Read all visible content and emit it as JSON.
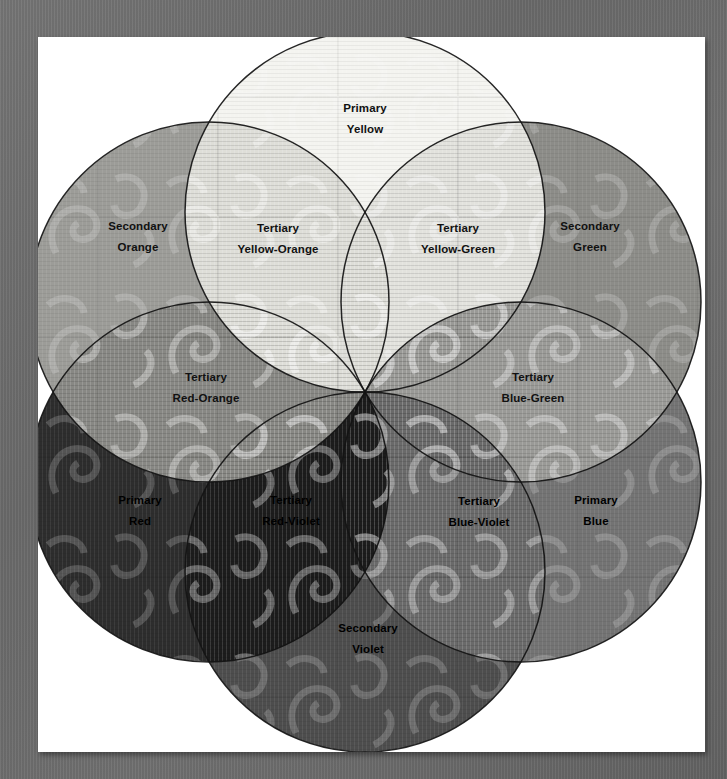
{
  "diagram": {
    "type": "color-wheel-venn",
    "center": {
      "x": 327,
      "y": 355
    },
    "radius": 180,
    "circle_count": 6,
    "petal_count": 12,
    "background": "#ffffff",
    "frame_color": "#6e6e6e",
    "outline_color": "#1a1a1a",
    "note": "Grayscale reproduction of a color wheel; hues rendered as gray tones"
  },
  "circles": [
    {
      "name": "yellow",
      "label": "Yellow",
      "angle_deg": 270,
      "tone": "#f2f2ee",
      "cx": 327,
      "cy": 175
    },
    {
      "name": "green",
      "label": "Green",
      "angle_deg": 330,
      "tone": "#8d8d8a",
      "cx": 483,
      "cy": 265
    },
    {
      "name": "blue",
      "label": "Blue",
      "angle_deg": 30,
      "tone": "#6f6f6f",
      "cx": 483,
      "cy": 445
    },
    {
      "name": "violet",
      "label": "Violet",
      "angle_deg": 90,
      "tone": "#4b4b4b",
      "cx": 327,
      "cy": 535
    },
    {
      "name": "red",
      "label": "Red",
      "angle_deg": 150,
      "tone": "#2c2c2c",
      "cx": 171,
      "cy": 445
    },
    {
      "name": "orange",
      "label": "Orange",
      "angle_deg": 210,
      "tone": "#9e9e9a",
      "cx": 171,
      "cy": 265
    }
  ],
  "petals": [
    {
      "id": "primary-yellow",
      "tier": "Primary",
      "color": "Yellow",
      "kind": "primary",
      "tone": "#f4f4f0",
      "text_on_dark": false,
      "label_x": 327,
      "label_y": 82
    },
    {
      "id": "tertiary-yellow-green",
      "tier": "Tertiary",
      "color": "Yellow-Green",
      "kind": "tertiary",
      "tone": "#e2e2dd",
      "text_on_dark": false,
      "label_x": 420,
      "label_y": 202
    },
    {
      "id": "secondary-green",
      "tier": "Secondary",
      "color": "Green",
      "kind": "secondary",
      "tone": "#8c8c88",
      "text_on_dark": false,
      "label_x": 552,
      "label_y": 200
    },
    {
      "id": "tertiary-blue-green",
      "tier": "Tertiary",
      "color": "Blue-Green",
      "kind": "tertiary",
      "tone": "#9a9a97",
      "text_on_dark": false,
      "label_x": 495,
      "label_y": 351
    },
    {
      "id": "primary-blue",
      "tier": "Primary",
      "color": "Blue",
      "kind": "primary",
      "tone": "#737373",
      "text_on_dark": true,
      "label_x": 558,
      "label_y": 474
    },
    {
      "id": "tertiary-blue-violet",
      "tier": "Tertiary",
      "color": "Blue-Violet",
      "kind": "tertiary",
      "tone": "#6a6a6a",
      "text_on_dark": true,
      "label_x": 441,
      "label_y": 475
    },
    {
      "id": "secondary-violet",
      "tier": "Secondary",
      "color": "Violet",
      "kind": "secondary",
      "tone": "#4d4d4d",
      "text_on_dark": true,
      "label_x": 330,
      "label_y": 602
    },
    {
      "id": "tertiary-red-violet",
      "tier": "Tertiary",
      "color": "Red-Violet",
      "kind": "tertiary",
      "tone": "#1c1c1c",
      "text_on_dark": true,
      "label_x": 253,
      "label_y": 474
    },
    {
      "id": "primary-red",
      "tier": "Primary",
      "color": "Red",
      "kind": "primary",
      "tone": "#2d2d2d",
      "text_on_dark": true,
      "label_x": 102,
      "label_y": 474
    },
    {
      "id": "tertiary-red-orange",
      "tier": "Tertiary",
      "color": "Red-Orange",
      "kind": "tertiary",
      "tone": "#888884",
      "text_on_dark": false,
      "label_x": 168,
      "label_y": 351
    },
    {
      "id": "secondary-orange",
      "tier": "Secondary",
      "color": "Orange",
      "kind": "secondary",
      "tone": "#9c9c98",
      "text_on_dark": false,
      "label_x": 100,
      "label_y": 200
    },
    {
      "id": "tertiary-yellow-orange",
      "tier": "Tertiary",
      "color": "Yellow-Orange",
      "kind": "tertiary",
      "tone": "#dedeD8",
      "text_on_dark": false,
      "label_x": 240,
      "label_y": 202
    }
  ]
}
